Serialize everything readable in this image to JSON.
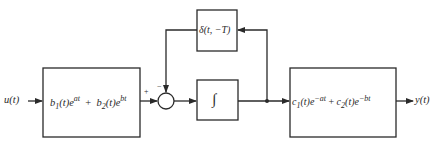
{
  "diagram": {
    "type": "block-diagram",
    "input_label": "u(t)",
    "output_label": "y(t)",
    "blocks": [
      {
        "id": "input-modulator",
        "label": "b₁(t)e^{at} + b₂(t)e^{bt}",
        "text": {
          "part1": "b",
          "sub1": "1",
          "part2": "(t)e",
          "sup1": "at",
          "plus": "+",
          "part3": "b",
          "sub2": "2",
          "part4": "(t)e",
          "sup2": "bt"
        }
      },
      {
        "id": "summing-junction",
        "signs": {
          "plus": "+",
          "minus": "−"
        }
      },
      {
        "id": "integrator",
        "label": "∫"
      },
      {
        "id": "delay",
        "label": "δ(t, −T)"
      },
      {
        "id": "output-demodulator",
        "label": "c₁(t)e^{−at} + c₂(t)e^{−bt}",
        "text": {
          "part1": "c",
          "sub1": "1",
          "part2": "(t)e",
          "sup1": "−at",
          "plus": "+",
          "part3": "c",
          "sub2": "2",
          "part4": "(t)e",
          "sup2": "−bt"
        }
      }
    ],
    "colors": {
      "line": "#2a2a2a",
      "background": "#ffffff"
    }
  }
}
